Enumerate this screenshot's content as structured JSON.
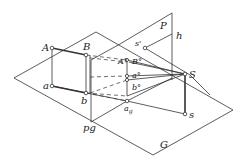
{
  "diagram": {
    "type": "perspective-projection",
    "planes": {
      "picture_plane": "P",
      "ground_plane": "G",
      "ground_line": "pg",
      "horizon": "h"
    },
    "points": {
      "A": "A",
      "B": "B",
      "a": "a",
      "b": "b",
      "S": "S",
      "s": "s",
      "s_prime": "s'",
      "A_persp": "A°",
      "B_persp": "B°",
      "a_persp": "a°",
      "b_persp": "b°",
      "a_g": "a",
      "a_g_sub": "g"
    },
    "colors": {
      "stroke": "#333333",
      "text": "#222222",
      "background": "#ffffff"
    }
  }
}
